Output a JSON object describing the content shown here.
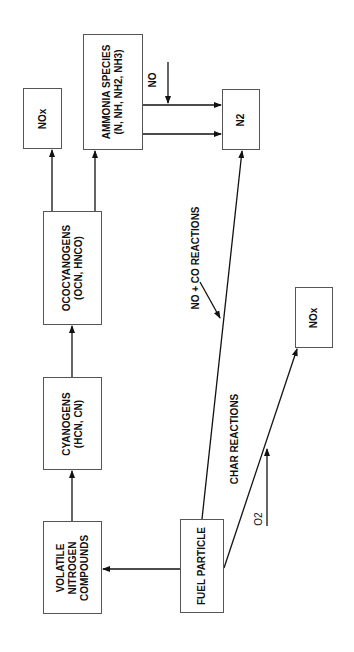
{
  "diagram": {
    "nodes": {
      "nox_top": {
        "label": "NOx"
      },
      "ammonia": {
        "line1": "AMMONIA SPECIES",
        "line2": "(N, NH, NH2, NH3)"
      },
      "n2": {
        "label": "N2"
      },
      "ococyanogens": {
        "line1": "OCOCYANOGENS",
        "line2": "(OCN, HNCO)"
      },
      "cyanogens": {
        "line1": "CYANOGENS",
        "line2": "(HCN, CN)"
      },
      "volatile": {
        "line1": "VOLATILE",
        "line2": "NITROGEN",
        "line3": "COMPOUNDS"
      },
      "fuel": {
        "label": "FUEL PARTICLE"
      },
      "nox_right": {
        "label": "NOx"
      }
    },
    "edge_labels": {
      "no": "NO",
      "no_co": "NO + CO REACTIONS",
      "char": "CHAR REACTIONS",
      "o2": "O2"
    },
    "colors": {
      "line": "#111111",
      "box_border": "#555555"
    }
  }
}
